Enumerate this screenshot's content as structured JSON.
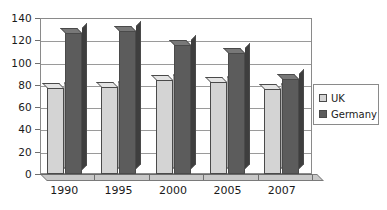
{
  "chart_data": {
    "type": "bar",
    "title": "",
    "xlabel": "",
    "ylabel": "",
    "categories": [
      "1990",
      "1995",
      "2000",
      "2005",
      "2007"
    ],
    "series": [
      {
        "name": "UK",
        "color": "#d4d4d4",
        "values": [
          77,
          78,
          84,
          83,
          76
        ]
      },
      {
        "name": "Germany",
        "color": "#5c5c5c",
        "values": [
          127,
          128,
          116,
          109,
          85
        ]
      }
    ],
    "ylim": [
      0,
      140
    ],
    "yticks": [
      0,
      20,
      40,
      60,
      80,
      100,
      120,
      140
    ],
    "ytick_labels": [
      "0",
      "20",
      "40",
      "60",
      "80",
      "100",
      "120",
      "140"
    ],
    "grid": "horizontal",
    "legend_position": "right",
    "legend_entries": [
      "UK",
      "Germany"
    ]
  }
}
